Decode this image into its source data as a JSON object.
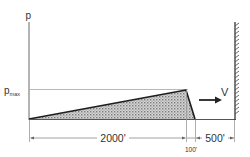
{
  "diagram": {
    "axis_label": "p",
    "pmax_label_main": "p",
    "pmax_label_sub": "max",
    "velocity_label": "V",
    "dimensions": {
      "ramp_length": "2000'",
      "drop_length": "100'",
      "gap_to_wall": "500'"
    },
    "colors": {
      "line": "#222222",
      "thin_line": "#8a8a8a",
      "fill": "#bdbdbd",
      "background": "#ffffff"
    }
  }
}
